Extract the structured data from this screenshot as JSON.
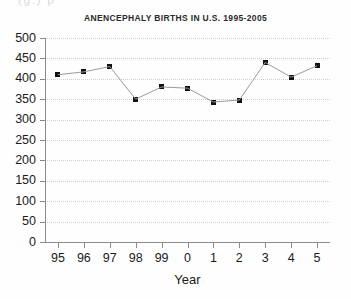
{
  "scan": {
    "clipped_top_text": "(g.) p"
  },
  "chart_data": {
    "type": "line",
    "title": "ANENCEPHALY BIRTHS IN U.S. 1995-2005",
    "xlabel": "Year",
    "ylabel": "",
    "grid": true,
    "legend": "none",
    "ylim": [
      0,
      500
    ],
    "ytick_step": 50,
    "yticks": [
      500,
      450,
      400,
      350,
      300,
      250,
      200,
      150,
      100,
      50,
      0
    ],
    "ytick_labels": [
      "500",
      "450",
      "400",
      "350",
      "300",
      "250",
      "200",
      "150",
      "100",
      "50",
      "0"
    ],
    "categories": [
      "95",
      "96",
      "97",
      "98",
      "99",
      "0",
      "1",
      "2",
      "3",
      "4",
      "5"
    ],
    "full_years": [
      1995,
      1996,
      1997,
      1998,
      1999,
      2000,
      2001,
      2002,
      2003,
      2004,
      2005
    ],
    "values": [
      410,
      417,
      430,
      350,
      380,
      377,
      343,
      348,
      440,
      404,
      432
    ],
    "marker": "square",
    "marker_color": "#111111",
    "line_color": "#9a9a9a",
    "gridline_color": "#cfcfcf",
    "axis_color": "#8a8a8a"
  }
}
